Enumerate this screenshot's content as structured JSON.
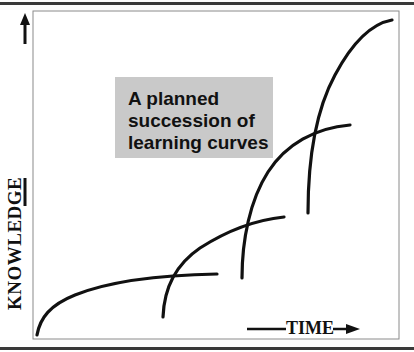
{
  "diagram": {
    "title_box": {
      "lines": [
        "A planned",
        "succession of",
        "learning curves"
      ],
      "background": "#c9c9c9"
    },
    "y_axis_label": "KNOWLEDGE",
    "x_axis_label": "TIME",
    "line_color": "#111111",
    "curves": [
      {
        "name": "curve-1",
        "start": [
          37,
          335
        ],
        "end": [
          217,
          274
        ]
      },
      {
        "name": "curve-2",
        "start": [
          163,
          317
        ],
        "end": [
          284,
          217
        ]
      },
      {
        "name": "curve-3",
        "start": [
          242,
          278
        ],
        "end": [
          350,
          125
        ]
      },
      {
        "name": "curve-4",
        "start": [
          308,
          213
        ],
        "end": [
          392,
          20
        ]
      }
    ]
  }
}
